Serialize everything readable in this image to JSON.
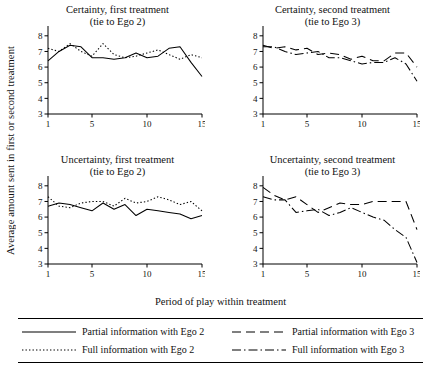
{
  "axis_label_y": "Average amount sent in first or second treatment",
  "axis_label_x": "Period of play within treatment",
  "panels": [
    {
      "id": "certainty-first",
      "title_line1": "Certainty, first treatment",
      "title_line2": "(tie to Ego 2)"
    },
    {
      "id": "certainty-second",
      "title_line1": "Certainty, second treatment",
      "title_line2": "(tie to Ego 3)"
    },
    {
      "id": "uncertainty-first",
      "title_line1": "Uncertainty, first treatment",
      "title_line2": "(tie to Ego 2)"
    },
    {
      "id": "uncertainty-second",
      "title_line1": "Uncertainty, second treatment",
      "title_line2": "(tie to Ego 3)"
    }
  ],
  "legend": [
    {
      "id": "partial-ego2",
      "label": "Partial information with Ego 2",
      "style": "solid"
    },
    {
      "id": "partial-ego3",
      "label": "Partial information with Ego 3",
      "style": "dashed"
    },
    {
      "id": "full-ego2",
      "label": "Full information with Ego 2",
      "style": "dotted"
    },
    {
      "id": "full-ego3",
      "label": "Full information with Ego 3",
      "style": "dashdot"
    }
  ],
  "chart_data": {
    "type": "line",
    "title": "",
    "xlabel": "Period of play within treatment",
    "ylabel": "Average amount sent in first or second treatment",
    "xlim": [
      1,
      15
    ],
    "ylim": [
      3,
      8.5
    ],
    "xticks": [
      1,
      5,
      10,
      15
    ],
    "yticks": [
      3,
      4,
      5,
      6,
      7,
      8
    ],
    "grid": false,
    "legend_position": "bottom",
    "panels": [
      {
        "name": "Certainty, first treatment (tie to Ego 2)",
        "x": [
          1,
          2,
          3,
          4,
          5,
          6,
          7,
          8,
          9,
          10,
          11,
          12,
          13,
          14,
          15
        ],
        "series": [
          {
            "name": "Partial information with Ego 2",
            "style": "solid",
            "values": [
              6.4,
              7.0,
              7.4,
              7.3,
              6.6,
              6.6,
              6.5,
              6.6,
              6.9,
              6.6,
              6.7,
              7.2,
              7.3,
              6.3,
              5.4
            ]
          },
          {
            "name": "Full information with Ego 2",
            "style": "dotted",
            "values": [
              7.2,
              7.0,
              7.5,
              7.0,
              6.7,
              7.5,
              6.8,
              6.6,
              6.7,
              6.9,
              7.1,
              6.8,
              6.5,
              6.8,
              6.6
            ]
          }
        ]
      },
      {
        "name": "Certainty, second treatment (tie to Ego 3)",
        "x": [
          1,
          2,
          3,
          4,
          5,
          6,
          7,
          8,
          9,
          10,
          11,
          12,
          13,
          14,
          15
        ],
        "series": [
          {
            "name": "Partial information with Ego 3",
            "style": "dashed",
            "values": [
              7.4,
              7.2,
              7.3,
              7.1,
              7.2,
              6.8,
              6.9,
              6.8,
              6.5,
              6.7,
              6.4,
              6.4,
              6.9,
              6.9,
              6.0
            ]
          },
          {
            "name": "Full information with Ego 3",
            "style": "dashdot",
            "values": [
              7.3,
              7.3,
              7.0,
              6.8,
              6.9,
              7.0,
              6.6,
              6.6,
              6.4,
              6.2,
              6.3,
              6.3,
              6.6,
              6.2,
              5.1
            ]
          }
        ]
      },
      {
        "name": "Uncertainty, first treatment (tie to Ego 2)",
        "x": [
          1,
          2,
          3,
          4,
          5,
          6,
          7,
          8,
          9,
          10,
          11,
          12,
          13,
          14,
          15
        ],
        "series": [
          {
            "name": "Partial information with Ego 2",
            "style": "solid",
            "values": [
              6.7,
              6.9,
              6.8,
              6.6,
              6.4,
              6.9,
              6.5,
              6.8,
              6.1,
              6.5,
              6.4,
              6.3,
              6.2,
              5.9,
              6.1
            ]
          },
          {
            "name": "Full information with Ego 2",
            "style": "dotted",
            "values": [
              7.3,
              6.7,
              6.6,
              6.9,
              7.0,
              7.0,
              6.7,
              7.2,
              6.9,
              7.0,
              7.3,
              7.1,
              6.8,
              7.0,
              6.4
            ]
          }
        ]
      },
      {
        "name": "Uncertainty, second treatment (tie to Ego 3)",
        "x": [
          1,
          2,
          3,
          4,
          5,
          6,
          7,
          8,
          9,
          10,
          11,
          12,
          13,
          14,
          15
        ],
        "series": [
          {
            "name": "Partial information with Ego 3",
            "style": "dashed",
            "values": [
              7.9,
              7.4,
              7.1,
              7.3,
              6.8,
              6.3,
              6.6,
              6.9,
              6.8,
              6.8,
              7.0,
              7.0,
              7.0,
              7.0,
              5.2
            ]
          },
          {
            "name": "Full information with Ego 3",
            "style": "dashdot",
            "values": [
              7.3,
              7.1,
              7.1,
              6.3,
              6.4,
              6.5,
              6.1,
              6.3,
              6.6,
              6.3,
              6.0,
              5.8,
              5.2,
              4.7,
              3.1
            ]
          }
        ]
      }
    ]
  }
}
